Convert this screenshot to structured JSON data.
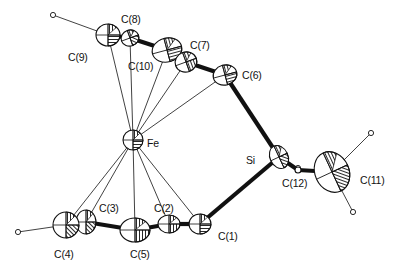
{
  "diagram": {
    "type": "ORTEP molecular structure",
    "atoms": [
      {
        "id": "C8",
        "label": "C(8)",
        "x": 130,
        "y": 38,
        "lx": 121,
        "ly": 14
      },
      {
        "id": "C9",
        "label": "C(9)",
        "x": 108,
        "y": 35,
        "lx": 68,
        "ly": 52
      },
      {
        "id": "C10",
        "label": "C(10)",
        "x": 167,
        "y": 50,
        "lx": 128,
        "ly": 61
      },
      {
        "id": "C7",
        "label": "C(7)",
        "x": 186,
        "y": 62,
        "lx": 190,
        "ly": 40
      },
      {
        "id": "C6",
        "label": "C(6)",
        "x": 225,
        "y": 75,
        "lx": 242,
        "ly": 70
      },
      {
        "id": "Fe",
        "label": "Fe",
        "x": 133,
        "y": 140,
        "lx": 147,
        "ly": 138
      },
      {
        "id": "Si",
        "label": "Si",
        "x": 279,
        "y": 157,
        "lx": 246,
        "ly": 155
      },
      {
        "id": "C12",
        "label": "C(12)",
        "x": 298,
        "y": 170,
        "lx": 282,
        "ly": 178
      },
      {
        "id": "C11",
        "label": "C(11)",
        "x": 332,
        "y": 172,
        "lx": 360,
        "ly": 175
      },
      {
        "id": "C1",
        "label": "C(1)",
        "x": 200,
        "y": 224,
        "lx": 218,
        "ly": 231
      },
      {
        "id": "C2",
        "label": "C(2)",
        "x": 169,
        "y": 224,
        "lx": 154,
        "ly": 203
      },
      {
        "id": "C3",
        "label": "C(3)",
        "x": 86,
        "y": 222,
        "lx": 99,
        "ly": 203
      },
      {
        "id": "C4",
        "label": "C(4)",
        "x": 66,
        "y": 225,
        "lx": 54,
        "ly": 249
      },
      {
        "id": "C5",
        "label": "C(5)",
        "x": 135,
        "y": 230,
        "lx": 130,
        "ly": 249
      }
    ],
    "bonds": [
      [
        "C9",
        "C8"
      ],
      [
        "C8",
        "C10"
      ],
      [
        "C10",
        "C7"
      ],
      [
        "C7",
        "C6"
      ],
      [
        "C6",
        "Si"
      ],
      [
        "Si",
        "C1"
      ],
      [
        "Si",
        "C12"
      ],
      [
        "C12",
        "C11"
      ],
      [
        "C1",
        "C2"
      ],
      [
        "C2",
        "C5"
      ],
      [
        "C5",
        "C3"
      ],
      [
        "C3",
        "C4"
      ]
    ],
    "fe_contacts": [
      "C9",
      "C8",
      "C10",
      "C7",
      "C6",
      "C4",
      "C3",
      "C5",
      "C2",
      "C1"
    ],
    "hydrogens": [
      {
        "from": "C9",
        "x": 53,
        "y": 15
      },
      {
        "from": "C4",
        "x": 18,
        "y": 232
      },
      {
        "from": "C5",
        "x": 143,
        "y": 233
      },
      {
        "from": "C11",
        "x": 371,
        "y": 133
      },
      {
        "from": "C11",
        "x": 353,
        "y": 212
      },
      {
        "from": "C12",
        "x": 298,
        "y": 168
      }
    ],
    "colors": {
      "ink": "#111111",
      "background": "#ffffff"
    }
  }
}
